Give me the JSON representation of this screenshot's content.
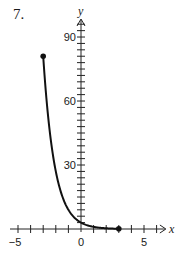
{
  "problem_number": "7.",
  "chart_data": {
    "type": "line",
    "title": "",
    "xlabel": "x",
    "ylabel": "y",
    "xlim": [
      -5.5,
      6.5
    ],
    "ylim": [
      0,
      100
    ],
    "x_tick_labels": [
      "-5",
      "0",
      "5"
    ],
    "x_tick_step": 1,
    "y_tick_labels": [
      "30",
      "60",
      "90"
    ],
    "y_tick_step": 3,
    "grid": false,
    "series": [
      {
        "name": "f(x)",
        "x": [
          -3,
          -2.5,
          -2,
          -1.5,
          -1,
          -0.5,
          0,
          0.5,
          1,
          1.5,
          2,
          2.5,
          3
        ],
        "values": [
          81,
          46.8,
          27,
          15.6,
          9,
          5.2,
          3,
          1.73,
          1,
          0.58,
          0.33,
          0.19,
          0.11
        ],
        "endpoints": [
          {
            "x": -3,
            "y": 81,
            "closed": true
          },
          {
            "x": 3,
            "y": 0.11,
            "closed": true
          }
        ]
      }
    ]
  }
}
